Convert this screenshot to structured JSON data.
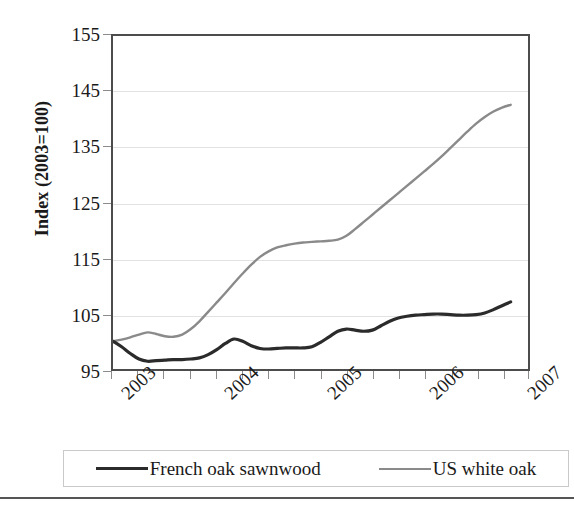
{
  "chart_data": {
    "type": "line",
    "title": "",
    "subtitle": "",
    "xlabel": "",
    "ylabel": "Index (2003=100)",
    "ylim": [
      95,
      155
    ],
    "yticks": [
      95,
      105,
      115,
      125,
      135,
      145,
      155
    ],
    "ytick_labels": [
      "95",
      "105",
      "115",
      "125",
      "135",
      "145",
      "155"
    ],
    "xlim": [
      2003.0,
      2007.0
    ],
    "xticks": [
      2003,
      2004,
      2005,
      2006,
      2007
    ],
    "xtick_labels": [
      "2003",
      "2004",
      "2005",
      "2006",
      "2007"
    ],
    "grid": "horizontal",
    "legend_position": "bottom",
    "x": [
      2003.0,
      2003.083,
      2003.167,
      2003.25,
      2003.333,
      2003.417,
      2003.5,
      2003.583,
      2003.667,
      2003.75,
      2003.833,
      2003.917,
      2004.0,
      2004.083,
      2004.167,
      2004.25,
      2004.333,
      2004.417,
      2004.5,
      2004.583,
      2004.667,
      2004.75,
      2004.833,
      2004.917,
      2005.0,
      2005.083,
      2005.167,
      2005.25,
      2005.333,
      2005.417,
      2005.5,
      2005.583,
      2005.667,
      2005.75,
      2005.833,
      2005.917,
      2006.0,
      2006.083,
      2006.167,
      2006.25,
      2006.333,
      2006.417,
      2006.5,
      2006.583,
      2006.667,
      2006.75,
      2006.833
    ],
    "series": [
      {
        "name": "French oak sawnwood",
        "color": "#2b2b2b",
        "line_width": 3.2,
        "values": [
          100.0,
          99.0,
          97.8,
          96.8,
          96.4,
          96.5,
          96.6,
          96.7,
          96.7,
          96.8,
          97.0,
          97.6,
          98.5,
          99.6,
          100.4,
          100.0,
          99.2,
          98.7,
          98.6,
          98.7,
          98.8,
          98.8,
          98.8,
          99.0,
          99.8,
          100.8,
          101.8,
          102.2,
          102.0,
          101.8,
          102.0,
          102.8,
          103.6,
          104.2,
          104.5,
          104.7,
          104.8,
          104.9,
          104.9,
          104.8,
          104.7,
          104.7,
          104.8,
          105.1,
          105.7,
          106.4,
          107.1
        ]
      },
      {
        "name": "US white oak",
        "color": "#8a8a8a",
        "line_width": 2.4,
        "values": [
          100.0,
          100.3,
          100.7,
          101.2,
          101.6,
          101.3,
          100.9,
          100.8,
          101.2,
          102.2,
          103.6,
          105.3,
          107.0,
          108.7,
          110.5,
          112.2,
          113.8,
          115.2,
          116.2,
          116.9,
          117.3,
          117.6,
          117.8,
          117.9,
          118.0,
          118.1,
          118.3,
          119.0,
          120.2,
          121.5,
          122.8,
          124.1,
          125.4,
          126.7,
          128.0,
          129.3,
          130.6,
          131.9,
          133.3,
          134.8,
          136.3,
          137.8,
          139.2,
          140.4,
          141.4,
          142.1,
          142.6
        ]
      }
    ]
  },
  "axes": {
    "y_title": "Index (2003=100)",
    "y_tick_labels": [
      "155",
      "145",
      "135",
      "125",
      "115",
      "105",
      "95"
    ],
    "x_tick_labels": [
      "2003",
      "2004",
      "2005",
      "2006",
      "2007"
    ]
  },
  "legend": {
    "entries": [
      {
        "label": "French oak sawnwood",
        "color": "#2b2b2b",
        "thickness": "3px"
      },
      {
        "label": "US white oak",
        "color": "#8a8a8a",
        "thickness": "2px"
      }
    ]
  }
}
